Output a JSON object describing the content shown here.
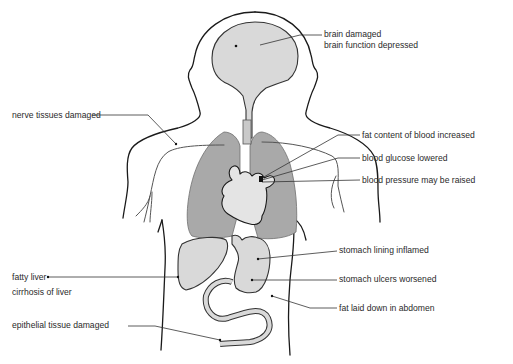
{
  "figure": {
    "colors": {
      "background": "#ffffff",
      "organ_fill": "#d9d9d9",
      "lung_fill": "#a9a9a9",
      "outline": "#1a1a1a",
      "label_text": "#2a2a2a"
    }
  },
  "labels": {
    "brain_1": "brain damaged",
    "brain_2": "brain function depressed",
    "nerve": "nerve tissues damaged",
    "fat_blood": "fat content of blood increased",
    "glucose": "blood glucose lowered",
    "pressure": "blood pressure may be raised",
    "stomach_lining": "stomach lining inflamed",
    "fatty_liver": "fatty liver",
    "cirrhosis": "cirrhosis of liver",
    "ulcers": "stomach ulcers worsened",
    "fat_abdomen": "fat laid down in abdomen",
    "epithelial": "epithelial tissue damaged"
  }
}
